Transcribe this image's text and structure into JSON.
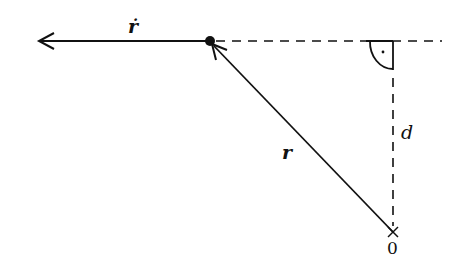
{
  "diagram": {
    "labels": {
      "velocity": "ṙ",
      "position": "r",
      "distance": "d",
      "origin": "0"
    },
    "elements": [
      {
        "type": "arrow",
        "name": "velocity-vector",
        "from": [
          210,
          41
        ],
        "to": [
          38,
          41
        ],
        "label": "ṙ"
      },
      {
        "type": "arrow",
        "name": "position-vector",
        "from": [
          393,
          232
        ],
        "to": [
          210,
          41
        ],
        "label": "r"
      },
      {
        "type": "dashed-line",
        "name": "horizontal-extension",
        "from": [
          210,
          41
        ],
        "to": [
          442,
          41
        ]
      },
      {
        "type": "dashed-line",
        "name": "perpendicular-distance",
        "from": [
          393,
          41
        ],
        "to": [
          393,
          228
        ],
        "label": "d"
      },
      {
        "type": "right-angle-marker",
        "at": [
          393,
          41
        ]
      },
      {
        "type": "point",
        "name": "particle",
        "at": [
          210,
          41
        ]
      },
      {
        "type": "cross",
        "name": "origin",
        "at": [
          393,
          232
        ],
        "label": "0"
      }
    ],
    "colors": {
      "stroke": "#111111",
      "background": "#ffffff"
    }
  }
}
